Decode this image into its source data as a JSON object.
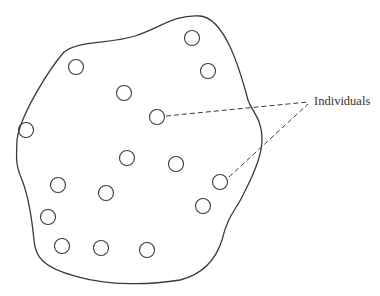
{
  "diagram": {
    "title": "",
    "label": "Individuals",
    "stroke_color": "#3a3a3a",
    "individual_radius": 7.5,
    "individuals": [
      {
        "x": 192,
        "y": 38
      },
      {
        "x": 208,
        "y": 71
      },
      {
        "x": 76,
        "y": 67
      },
      {
        "x": 124,
        "y": 93
      },
      {
        "x": 157,
        "y": 117
      },
      {
        "x": 26,
        "y": 130
      },
      {
        "x": 127,
        "y": 158
      },
      {
        "x": 176,
        "y": 164
      },
      {
        "x": 220,
        "y": 182
      },
      {
        "x": 58,
        "y": 185
      },
      {
        "x": 106,
        "y": 193
      },
      {
        "x": 203,
        "y": 206
      },
      {
        "x": 48,
        "y": 217
      },
      {
        "x": 62,
        "y": 246
      },
      {
        "x": 101,
        "y": 248
      },
      {
        "x": 147,
        "y": 250
      }
    ],
    "leader_lines": [
      {
        "from": {
          "x": 166,
          "y": 116
        },
        "to": {
          "x": 308,
          "y": 102
        }
      },
      {
        "from": {
          "x": 229,
          "y": 177
        },
        "to": {
          "x": 308,
          "y": 104
        }
      }
    ]
  }
}
